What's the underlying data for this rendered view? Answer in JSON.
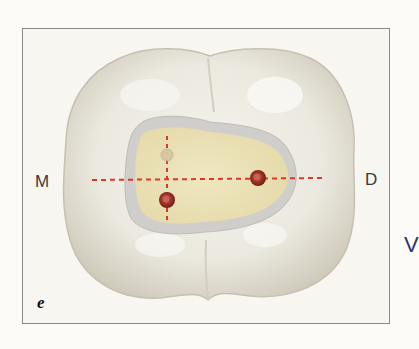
{
  "figure": {
    "panel_label": "e",
    "labels": {
      "mesial": "M",
      "distal": "D"
    },
    "edge_text": "V",
    "colors": {
      "background": "#fcfbf8",
      "frame_border": "#8a8a88",
      "frame_fill": "#f8f6f1",
      "tooth_outer": "#dcd8cc",
      "tooth_highlight": "#f3f1ea",
      "cavity_wall": "#c9c8c6",
      "pulp_floor": "#ece3b9",
      "guide_line": "#d9392a",
      "canal_orifice": "#a8352a"
    },
    "guide_lines": [
      {
        "orientation": "horizontal",
        "style": "dashed"
      },
      {
        "orientation": "vertical",
        "style": "dashed"
      }
    ],
    "canal_orifices": [
      {
        "name": "mesiobuccal-orifice",
        "faint": true
      },
      {
        "name": "mesiolingual-orifice",
        "faint": false
      },
      {
        "name": "distal-orifice",
        "faint": false
      }
    ]
  }
}
